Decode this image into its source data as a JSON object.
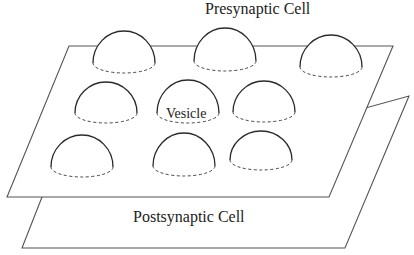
{
  "diagram": {
    "labels": {
      "presynaptic": "Presynaptic Cell",
      "postsynaptic": "Postsynaptic Cell",
      "vesicle": "Vesicle"
    },
    "colors": {
      "background": "#ffffff",
      "plane_stroke": "#555555",
      "dome_stroke": "#2a2a2a",
      "rim_stroke": "#444444",
      "text": "#222222"
    },
    "planes": {
      "postsynaptic": "42,197 409,96 345,248 22,248",
      "presynaptic": "69,46 393,46 329,197 7,197"
    },
    "vesicles": [
      {
        "id": "v1",
        "cx": 124,
        "cy": 63,
        "rx": 31,
        "ry": 10,
        "h": 32
      },
      {
        "id": "v2",
        "cx": 225,
        "cy": 61,
        "rx": 31,
        "ry": 10,
        "h": 33
      },
      {
        "id": "v3",
        "cx": 331,
        "cy": 67,
        "rx": 31,
        "ry": 10,
        "h": 32
      },
      {
        "id": "v4",
        "cx": 106,
        "cy": 113,
        "rx": 31,
        "ry": 10,
        "h": 31
      },
      {
        "id": "v5",
        "cx": 188,
        "cy": 113,
        "rx": 31,
        "ry": 10,
        "h": 33,
        "labeled": true
      },
      {
        "id": "v6",
        "cx": 264,
        "cy": 112,
        "rx": 31,
        "ry": 10,
        "h": 31
      },
      {
        "id": "v7",
        "cx": 82,
        "cy": 167,
        "rx": 31,
        "ry": 10,
        "h": 32
      },
      {
        "id": "v8",
        "cx": 184,
        "cy": 166,
        "rx": 31,
        "ry": 10,
        "h": 33
      },
      {
        "id": "v9",
        "cx": 261,
        "cy": 160,
        "rx": 31,
        "ry": 10,
        "h": 29
      }
    ]
  }
}
